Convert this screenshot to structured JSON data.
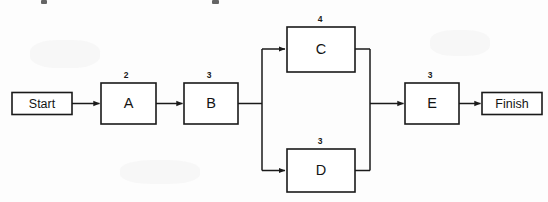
{
  "diagram": {
    "type": "activity-on-node network diagram",
    "background_color": "#fdfdfd",
    "line_color": "#1a1a1a",
    "start_terminal": {
      "label": "Start"
    },
    "finish_terminal": {
      "label": "Finish"
    },
    "nodes": [
      {
        "id": "A",
        "label": "A",
        "duration": "2"
      },
      {
        "id": "B",
        "label": "B",
        "duration": "3"
      },
      {
        "id": "C",
        "label": "C",
        "duration": "4"
      },
      {
        "id": "D",
        "label": "D",
        "duration": "3"
      },
      {
        "id": "E",
        "label": "E",
        "duration": "3"
      }
    ],
    "edges": [
      {
        "from": "Start",
        "to": "A"
      },
      {
        "from": "A",
        "to": "B"
      },
      {
        "from": "B",
        "to": "C"
      },
      {
        "from": "B",
        "to": "D"
      },
      {
        "from": "C",
        "to": "E"
      },
      {
        "from": "D",
        "to": "E"
      },
      {
        "from": "E",
        "to": "Finish"
      }
    ]
  }
}
